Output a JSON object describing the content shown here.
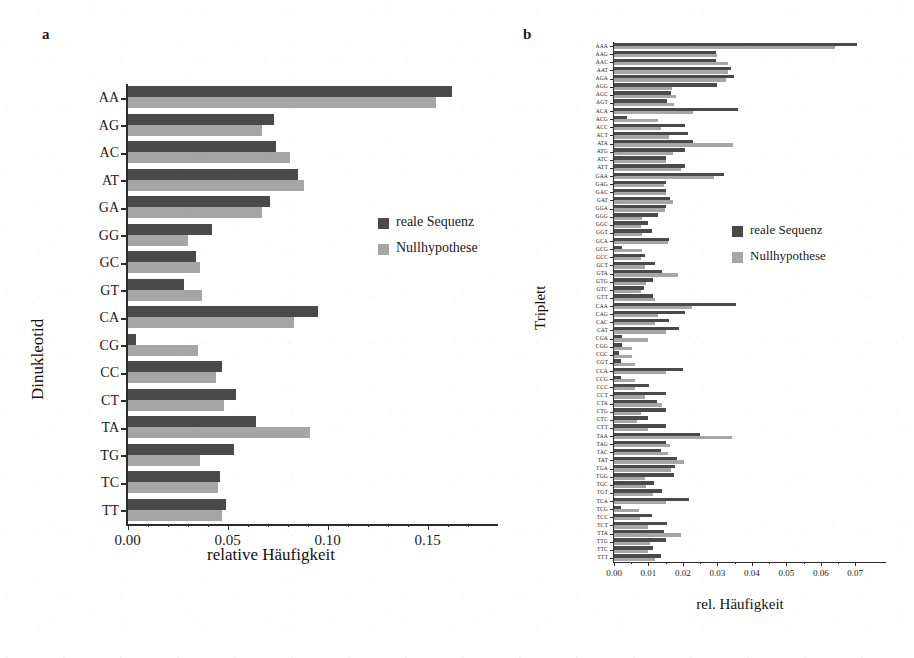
{
  "figure": {
    "panel_a_letter": "a",
    "panel_b_letter": "b"
  },
  "legend": {
    "real_label": "reale Sequenz",
    "null_label": "Nullhypothese",
    "real_color": "#4a4a4a",
    "null_color": "#a6a6a6"
  },
  "chart_data": [
    {
      "id": "panel_a",
      "type": "bar",
      "orientation": "horizontal",
      "panel_letter": "a",
      "title": "",
      "xlabel": "relative Häufigkeit",
      "ylabel": "Dinukleotid",
      "xlim": [
        0.0,
        0.17
      ],
      "xticks": [
        0.0,
        0.05,
        0.1,
        0.15
      ],
      "xticklabels": [
        "0.00",
        "0.05",
        "0.10",
        "0.15"
      ],
      "grid": false,
      "legend_position": "center-right",
      "categories": [
        "AA",
        "AG",
        "AC",
        "AT",
        "GA",
        "GG",
        "GC",
        "GT",
        "CA",
        "CG",
        "CC",
        "CT",
        "TA",
        "TG",
        "TC",
        "TT"
      ],
      "series": [
        {
          "name": "reale Sequenz",
          "color": "#4a4a4a",
          "values": [
            0.162,
            0.073,
            0.074,
            0.085,
            0.071,
            0.042,
            0.034,
            0.028,
            0.095,
            0.004,
            0.047,
            0.054,
            0.064,
            0.053,
            0.046,
            0.049
          ]
        },
        {
          "name": "Nullhypothese",
          "color": "#a6a6a6",
          "values": [
            0.154,
            0.067,
            0.081,
            0.088,
            0.067,
            0.03,
            0.036,
            0.037,
            0.083,
            0.035,
            0.044,
            0.048,
            0.091,
            0.036,
            0.045,
            0.047
          ]
        }
      ]
    },
    {
      "id": "panel_b",
      "type": "bar",
      "orientation": "horizontal",
      "panel_letter": "b",
      "title": "",
      "xlabel": "rel. Häufigkeit",
      "ylabel": "Triplett",
      "xlim": [
        0.0,
        0.074
      ],
      "xticks": [
        0.0,
        0.01,
        0.02,
        0.03,
        0.04,
        0.05,
        0.06,
        0.07
      ],
      "xticklabels": [
        "0.00",
        "0.01",
        "0.02",
        "0.03",
        "0.04",
        "0.05",
        "0.06",
        "0.07"
      ],
      "grid": false,
      "legend_position": "center-right",
      "categories": [
        "AAA",
        "AAG",
        "AAC",
        "AAT",
        "AGA",
        "AGG",
        "AGC",
        "AGT",
        "ACA",
        "ACG",
        "ACC",
        "ACT",
        "ATA",
        "ATG",
        "ATC",
        "ATT",
        "GAA",
        "GAG",
        "GAC",
        "GAT",
        "GGA",
        "GGG",
        "GGC",
        "GGT",
        "GCA",
        "GCG",
        "GCC",
        "GCT",
        "GTA",
        "GTG",
        "GTC",
        "GTT",
        "CAA",
        "CAG",
        "CAC",
        "CAT",
        "CGA",
        "CGG",
        "CGC",
        "CGT",
        "CCA",
        "CCG",
        "CCC",
        "CCT",
        "CTA",
        "CTG",
        "CTC",
        "CTT",
        "TAA",
        "TAG",
        "TAC",
        "TAT",
        "TGA",
        "TGG",
        "TGC",
        "TGT",
        "TCA",
        "TCG",
        "TCC",
        "TCT",
        "TTA",
        "TTG",
        "TTC",
        "TTT"
      ],
      "series": [
        {
          "name": "reale Sequenz",
          "color": "#4a4a4a",
          "values": [
            0.0705,
            0.0295,
            0.0295,
            0.034,
            0.0348,
            0.03,
            0.0165,
            0.0155,
            0.036,
            0.0037,
            0.0205,
            0.0215,
            0.0228,
            0.0205,
            0.015,
            0.0205,
            0.0318,
            0.015,
            0.015,
            0.0163,
            0.015,
            0.0128,
            0.01,
            0.011,
            0.016,
            0.0022,
            0.009,
            0.012,
            0.014,
            0.0112,
            0.0088,
            0.0112,
            0.0355,
            0.0205,
            0.016,
            0.019,
            0.0023,
            0.0022,
            0.0014,
            0.002,
            0.02,
            0.002,
            0.0102,
            0.015,
            0.0125,
            0.015,
            0.0098,
            0.015,
            0.025,
            0.015,
            0.0135,
            0.0182,
            0.0178,
            0.0175,
            0.0115,
            0.0138,
            0.0218,
            0.002,
            0.011,
            0.0155,
            0.0145,
            0.015,
            0.0112,
            0.0135
          ],
          "note": "estimated from bar lengths"
        },
        {
          "name": "Nullhypothese",
          "color": "#a6a6a6",
          "values": [
            0.064,
            0.03,
            0.033,
            0.033,
            0.0325,
            0.0168,
            0.018,
            0.0175,
            0.0228,
            0.0128,
            0.0135,
            0.016,
            0.0345,
            0.017,
            0.015,
            0.0195,
            0.029,
            0.0145,
            0.015,
            0.0172,
            0.0148,
            0.008,
            0.0078,
            0.008,
            0.0158,
            0.008,
            0.0078,
            0.009,
            0.0185,
            0.0092,
            0.0078,
            0.0118,
            0.0225,
            0.0128,
            0.012,
            0.015,
            0.01,
            0.0052,
            0.0052,
            0.0062,
            0.015,
            0.006,
            0.006,
            0.009,
            0.014,
            0.0078,
            0.0068,
            0.0098,
            0.0342,
            0.0162,
            0.0158,
            0.0202,
            0.0165,
            0.009,
            0.0092,
            0.0112,
            0.0152,
            0.0072,
            0.0075,
            0.0098,
            0.0195,
            0.0105,
            0.01,
            0.0118
          ],
          "note": "estimated from bar lengths"
        }
      ]
    }
  ]
}
